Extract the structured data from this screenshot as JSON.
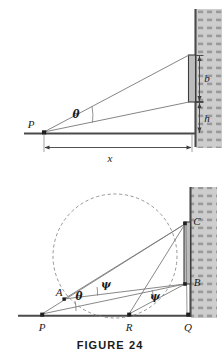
{
  "figure": {
    "caption": "FIGURE 24",
    "background_color": "#ffffff",
    "line_color": "#4a4a4a",
    "wall_fill": "#c9c9c9",
    "wall_edge_color": "#555555",
    "board_fill": "#bdbdbd",
    "dash_color": "#8a8a8a"
  },
  "upper_diagram": {
    "name": "viewing-angle-screen-diagram",
    "labels": {
      "point_p": "P",
      "angle_theta": "θ",
      "screen_height": "b",
      "screen_elevation": "h",
      "distance": "x"
    }
  },
  "lower_diagram": {
    "name": "circle-construction-diagram",
    "labels": {
      "point_p": "P",
      "point_a": "A",
      "point_r": "R",
      "point_q": "Q",
      "point_b": "B",
      "point_c": "C",
      "angle_theta": "θ",
      "angle_psi_upper": "ψ",
      "angle_psi_lower": "ψ"
    }
  }
}
